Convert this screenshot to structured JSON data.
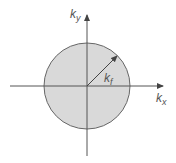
{
  "diagram": {
    "type": "fermi-circle",
    "colors": {
      "fill": "#d9d9d9",
      "stroke": "#666666",
      "axis": "#555555",
      "label": "#555555"
    },
    "labels": {
      "y_axis": {
        "main": "k",
        "sub": "y"
      },
      "x_axis": {
        "main": "k",
        "sub": "x"
      },
      "radius": {
        "main": "k",
        "sub": "f"
      }
    }
  }
}
